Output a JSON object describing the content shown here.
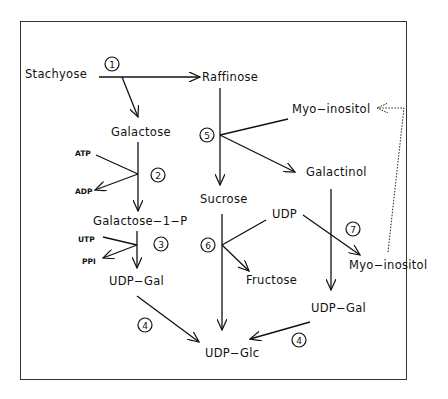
{
  "diagram": {
    "nodes": {
      "stachyose": "Stachyose",
      "raffinose": "Raffinose",
      "galactose": "Galactose",
      "atp": "ATP",
      "adp": "ADP",
      "galactose_1_p": "Galactose−1−P",
      "utp": "UTP",
      "ppi": "PPI",
      "udp_gal_left": "UDP−Gal",
      "myo_inositol_top": "Myo−inositol",
      "galactinol": "Galactinol",
      "sucrose": "Sucrose",
      "udp": "UDP",
      "fructose": "Fructose",
      "myo_inositol_bottom": "Myo−inositol",
      "udp_gal_right": "UDP−Gal",
      "udp_glc": "UDP−Glc"
    },
    "enzymes": {
      "e1": "1",
      "e2": "2",
      "e3": "3",
      "e4_left": "4",
      "e5": "5",
      "e6": "6",
      "e7": "7",
      "e4_right": "4"
    },
    "edges": [
      {
        "from": "Stachyose",
        "to": "Raffinose",
        "enzyme": "1"
      },
      {
        "from": "Stachyose",
        "to": "Galactose",
        "enzyme": "1"
      },
      {
        "from": "Galactose",
        "to": "Galactose-1-P",
        "enzyme": "2",
        "cofactors": [
          "ATP",
          "ADP"
        ]
      },
      {
        "from": "Galactose-1-P",
        "to": "UDP-Gal",
        "enzyme": "3",
        "cofactors": [
          "UTP",
          "PPI"
        ]
      },
      {
        "from": "UDP-Gal",
        "to": "UDP-Glc",
        "enzyme": "4"
      },
      {
        "from": "Raffinose",
        "to": "Sucrose",
        "enzyme": "5"
      },
      {
        "from": "Myo-inositol",
        "to": "Galactinol",
        "enzyme": "5"
      },
      {
        "from": "Sucrose",
        "to": "UDP-Glc",
        "enzyme": "6"
      },
      {
        "from": "UDP",
        "to": "Fructose",
        "enzyme": "6"
      },
      {
        "from": "Galactinol",
        "to": "UDP-Gal",
        "enzyme": "7"
      },
      {
        "from": "UDP",
        "to": "Myo-inositol",
        "enzyme": "7"
      },
      {
        "from": "UDP-Gal",
        "to": "UDP-Glc",
        "enzyme": "4"
      },
      {
        "from": "Myo-inositol",
        "to": "Myo-inositol",
        "style": "dotted",
        "note": "recycle"
      }
    ]
  }
}
